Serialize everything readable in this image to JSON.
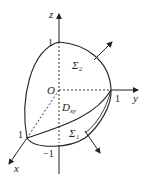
{
  "figure": {
    "axes": {
      "x_label": "x",
      "y_label": "y",
      "z_label": "z"
    },
    "origin_label": "O",
    "ticks": {
      "z_top": "1",
      "y_right": "1",
      "x_left": "1",
      "z_bottom": "−1"
    },
    "surfaces": {
      "upper": "Σ₂",
      "lower": "Σ₁"
    },
    "region": {
      "base": "D",
      "sub": "xy"
    },
    "colors": {
      "stroke": "#222222",
      "background": "#ffffff"
    }
  }
}
